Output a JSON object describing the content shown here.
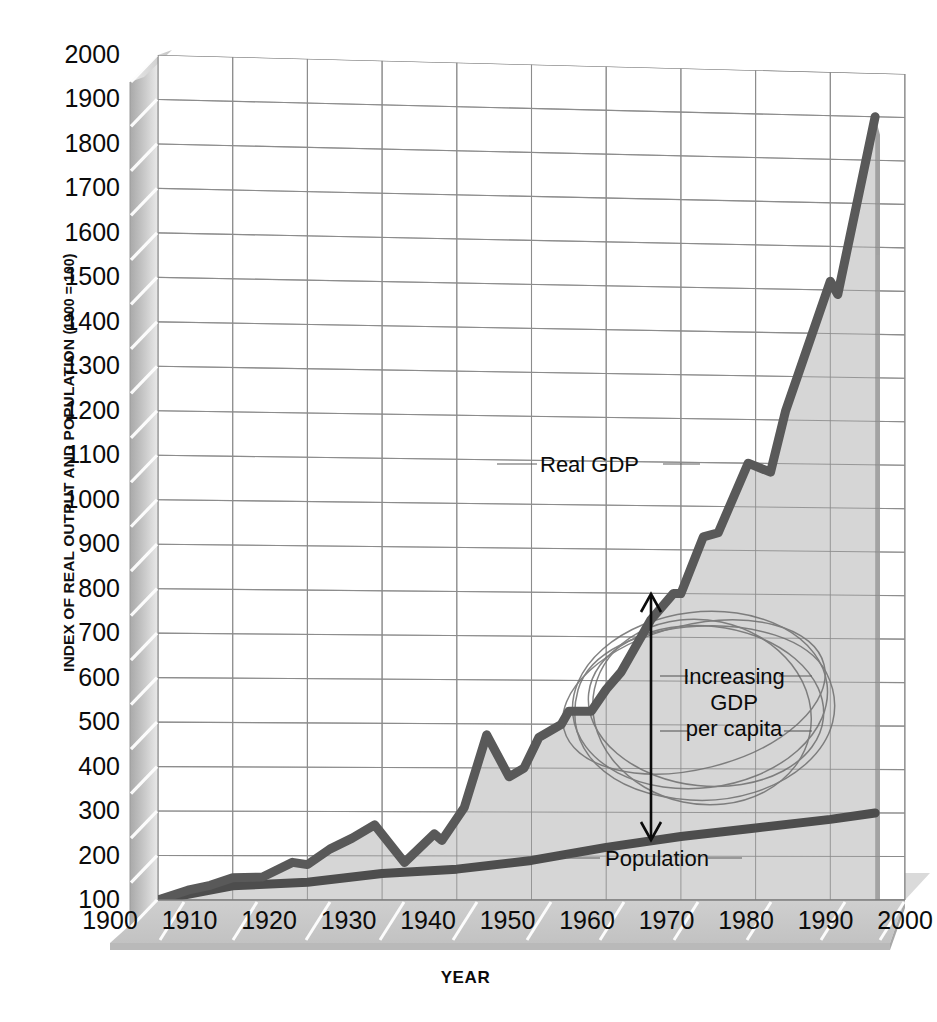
{
  "chart_data": {
    "type": "line",
    "title": "",
    "xlabel": "YEAR",
    "ylabel": "INDEX OF REAL OUTPUT AND POPULATION (1900 = 100)",
    "xlim": [
      1900,
      2000
    ],
    "ylim": [
      100,
      2000
    ],
    "grid": true,
    "legend": "inline-labels",
    "style": "3D walls and floor, light gray area fill under Real GDP, hand-drawn ellipse scribbles over the GDP-per-capita gap",
    "xticks": [
      "1900",
      "1910",
      "1920",
      "1930",
      "1940",
      "1950",
      "1960",
      "1970",
      "1980",
      "1990",
      "2000"
    ],
    "yticks": [
      "100",
      "200",
      "300",
      "400",
      "500",
      "600",
      "700",
      "800",
      "900",
      "1000",
      "1100",
      "1200",
      "1300",
      "1400",
      "1500",
      "1600",
      "1700",
      "1800",
      "1900",
      "2000"
    ],
    "series": [
      {
        "name": "Real GDP",
        "color": "#5a5a5a",
        "x": [
          1900,
          1904,
          1907,
          1910,
          1914,
          1918,
          1920,
          1923,
          1926,
          1929,
          1933,
          1937,
          1938,
          1941,
          1944,
          1947,
          1949,
          1951,
          1954,
          1955,
          1958,
          1960,
          1962,
          1966,
          1969,
          1970,
          1973,
          1975,
          1979,
          1982,
          1984,
          1990,
          1991,
          1996
        ],
        "values": [
          100,
          122,
          133,
          150,
          152,
          185,
          180,
          215,
          240,
          270,
          185,
          250,
          235,
          310,
          475,
          380,
          400,
          470,
          500,
          530,
          530,
          580,
          620,
          740,
          800,
          800,
          930,
          940,
          1100,
          1080,
          1220,
          1520,
          1490,
          1900
        ]
      },
      {
        "name": "Population",
        "color": "#4a4a4a",
        "x": [
          1900,
          1910,
          1920,
          1930,
          1940,
          1950,
          1960,
          1970,
          1980,
          1990,
          1996
        ],
        "values": [
          100,
          132,
          140,
          160,
          170,
          190,
          220,
          245,
          265,
          285,
          300
        ]
      }
    ],
    "annotations": [
      {
        "name": "real-gdp-label",
        "text": "Real GDP"
      },
      {
        "name": "population-label",
        "text": "Population"
      },
      {
        "name": "gdp-per-capita-label",
        "lines": [
          "Increasing",
          "GDP",
          "per capita"
        ]
      }
    ]
  },
  "axes": {
    "y_title": "INDEX OF REAL OUTPUT AND POPULATION",
    "y_title_paren": "(1900 = 100)",
    "x_title": "YEAR",
    "y_ticks": [
      "2000",
      "1900",
      "1800",
      "1700",
      "1600",
      "1500",
      "1400",
      "1300",
      "1200",
      "1100",
      "1000",
      "900",
      "800",
      "700",
      "600",
      "500",
      "400",
      "300",
      "200",
      "100"
    ],
    "x_ticks": [
      "1900",
      "1910",
      "1920",
      "1930",
      "1940",
      "1950",
      "1960",
      "1970",
      "1980",
      "1990",
      "2000"
    ]
  },
  "labels": {
    "real_gdp": "Real GDP",
    "population": "Population",
    "increasing": "Increasing",
    "gdp": "GDP",
    "per_capita": "per capita"
  },
  "colors": {
    "gdp_line": "#595959",
    "population_line": "#4d4d4d",
    "area_fill": "#d6d6d6",
    "grid": "#8c8c8c",
    "wall_light": "#dcdcdc",
    "wall_mid": "#c0c0c0",
    "wall_dark": "#9a9a9a",
    "floor": "#c9c9c9",
    "text": "#0b0b0b",
    "scribble": "#6e6e6e"
  }
}
